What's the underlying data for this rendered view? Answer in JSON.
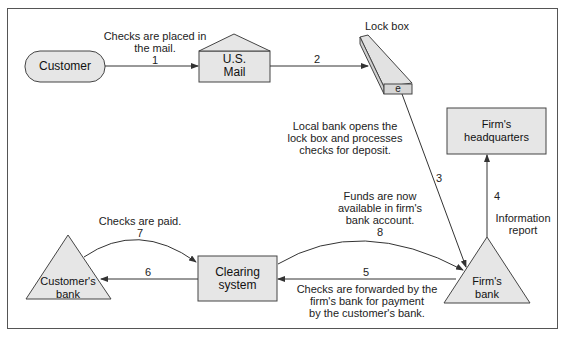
{
  "diagram": {
    "type": "flow",
    "colors": {
      "node_fill": "#e6e6e6",
      "stroke": "#444444",
      "frame": "#555555",
      "background": "#ffffff"
    },
    "nodes": {
      "customer": {
        "label": "Customer",
        "shape": "rounded-rect"
      },
      "us_mail": {
        "label_line1": "U.S.",
        "label_line2": "Mail",
        "shape": "envelope-house"
      },
      "lock_box": {
        "label": "Lock box",
        "tag": "e",
        "shape": "3d-box"
      },
      "firms_hq": {
        "label_line1": "Firm's",
        "label_line2": "headquarters",
        "shape": "rect"
      },
      "firms_bank": {
        "label_line1": "Firm's",
        "label_line2": "bank",
        "shape": "triangle"
      },
      "clearing": {
        "label_line1": "Clearing",
        "label_line2": "system",
        "shape": "rect"
      },
      "customers_bank": {
        "label_line1": "Customer's",
        "label_line2": "bank",
        "shape": "triangle"
      }
    },
    "edges": [
      {
        "step": "1",
        "from": "Customer",
        "to": "U.S. Mail",
        "label_line1": "Checks are placed in",
        "label_line2": "the mail."
      },
      {
        "step": "2",
        "from": "U.S. Mail",
        "to": "Lock box"
      },
      {
        "step": "3",
        "from": "Lock box",
        "to": "Firm's bank",
        "label_line1": "Local bank opens the",
        "label_line2": "lock box and processes",
        "label_line3": "checks for deposit."
      },
      {
        "step": "4",
        "from": "Firm's bank",
        "to": "Firm's headquarters",
        "label_line1": "Information",
        "label_line2": "report"
      },
      {
        "step": "5",
        "from": "Firm's bank",
        "to": "Clearing system",
        "label_line1": "Checks are forwarded by the",
        "label_line2": "firm's bank for payment",
        "label_line3": "by the customer's bank."
      },
      {
        "step": "6",
        "from": "Clearing system",
        "to": "Customer's bank"
      },
      {
        "step": "7",
        "from": "Customer's bank",
        "to": "Clearing system",
        "label_line1": "Checks are paid."
      },
      {
        "step": "8",
        "from": "Clearing system",
        "to": "Firm's bank",
        "label_line1": "Funds are now",
        "label_line2": "available in firm's",
        "label_line3": "bank account."
      }
    ]
  }
}
